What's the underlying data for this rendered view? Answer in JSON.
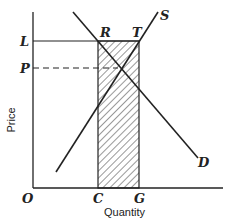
{
  "diagram": {
    "type": "supply-demand",
    "axes": {
      "x_title": "Quantity",
      "y_title": "Price",
      "origin_label": "O"
    },
    "price_levels": [
      {
        "label": "L",
        "style": "solid"
      },
      {
        "label": "P",
        "style": "dashed"
      }
    ],
    "quantity_levels": [
      {
        "label": "C"
      },
      {
        "label": "G"
      }
    ],
    "points": [
      {
        "label": "R"
      },
      {
        "label": "T"
      }
    ],
    "curves": [
      {
        "label": "S",
        "name": "supply"
      },
      {
        "label": "D",
        "name": "demand"
      }
    ],
    "shaded_region": {
      "description": "rectangle RTGC hatched",
      "pattern": "diagonal-hatch"
    }
  }
}
